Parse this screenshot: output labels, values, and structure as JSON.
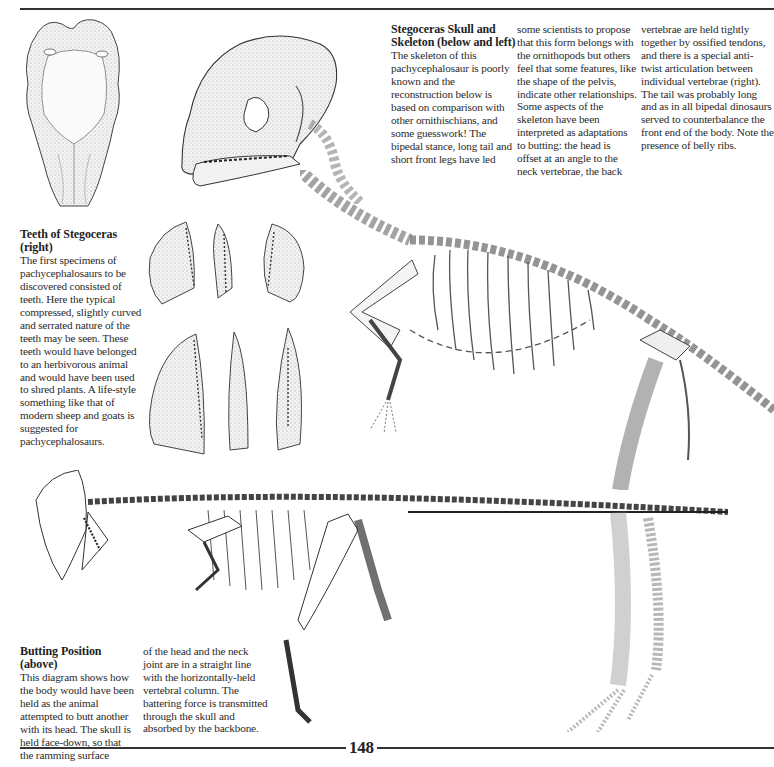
{
  "page": {
    "number": "148",
    "rule_color": "#333333"
  },
  "skull_skeleton_section": {
    "heading": "Stegoceras Skull and Skeleton (below and left)",
    "columns": [
      "The skeleton of this pachycephalosaur is poorly known and the reconstruction below is based on comparison with other ornithischians, and some guesswork! The bipedal stance, long tail and short front legs have led",
      "some scientists to propose that this form belongs with the ornithopods but others feel that some features, like the shape of the pelvis, indicate other relationships. Some aspects of the skeleton have been interpreted as adaptations to butting: the head is offset at an angle to the neck vertebrae, the back",
      "vertebrae are held tightly together by ossified tendons, and there is a special anti-twist articulation between individual vertebrae (right). The tail was probably long and as in all bipedal dinosaurs served to counterbalance the front end of the body. Note the presence of belly ribs."
    ]
  },
  "teeth_section": {
    "heading": "Teeth of Stegoceras (right)",
    "body": "The first specimens of pachycephalosaurs to be discovered consisted of teeth. Here the typical compressed, slightly curved and serrated nature of the teeth may be seen. These teeth would have belonged to an herbivorous animal and would have been used to shred plants. A life-style something like that of modern sheep and goats is suggested for pachycephalosaurs."
  },
  "butting_section": {
    "heading": "Butting Position (above)",
    "columns": [
      "This diagram shows how the body would have been held as the animal attempted to butt another with its head. The skull is held face-down, so that the ramming surface",
      "of the head and the neck joint are in a straight line with the horizontally-held vertebral column. The battering force is transmitted through the skull and absorbed by the backbone."
    ]
  },
  "illustrations": [
    {
      "id": "skull-top-view",
      "label": "Stegoceras skull, dorsal view"
    },
    {
      "id": "skull-side-view",
      "label": "Stegoceras skull, lateral view"
    },
    {
      "id": "teeth",
      "label": "Six teeth of Stegoceras"
    },
    {
      "id": "upright-skeleton",
      "label": "Stegoceras skeleton in bipedal stance"
    },
    {
      "id": "butting-skeleton",
      "label": "Stegoceras skeleton in butting position"
    }
  ]
}
